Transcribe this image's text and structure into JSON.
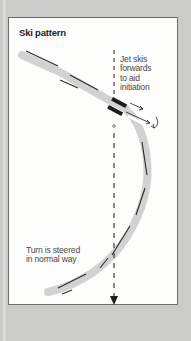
{
  "diagram": {
    "title": "Ski pattern",
    "annotations": {
      "jet": [
        "Jet skis",
        "forwards",
        "to aid",
        "initiation"
      ],
      "turn": [
        "Turn is steered",
        "in normal way"
      ]
    },
    "elements": {
      "track": "curved ski track (grey band with dark edge marks)",
      "fall_line": "vertical dashed line with downward arrow",
      "skis": "two dark ski tails with forward arrows at turn initiation"
    },
    "colors": {
      "frame": "#cbcbc9",
      "panel": "#fdfdfc",
      "track": "#cfcfcf",
      "ink": "#1e1e1e"
    }
  }
}
